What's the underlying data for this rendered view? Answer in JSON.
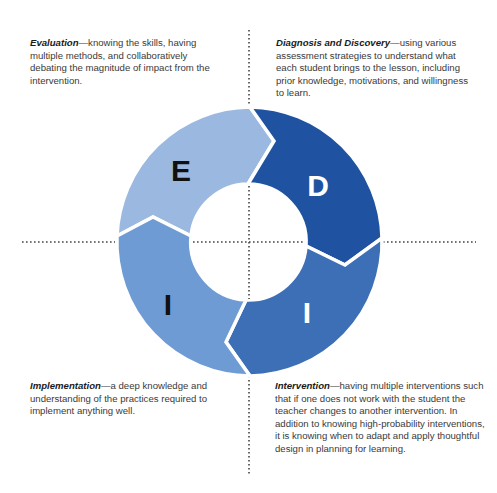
{
  "diagram": {
    "type": "cycle",
    "center": [
      249,
      242
    ],
    "outer_radius": 134,
    "inner_radius": 58,
    "segments": [
      {
        "id": "evaluation",
        "letter": "E",
        "color": "#9bb9e0",
        "letter_color": "#111111"
      },
      {
        "id": "diagnosis",
        "letter": "D",
        "color": "#1f52a0",
        "letter_color": "#ffffff"
      },
      {
        "id": "intervention",
        "letter": "I",
        "color": "#3d6fb6",
        "letter_color": "#ffffff"
      },
      {
        "id": "implementation",
        "letter": "I",
        "color": "#6e9bd4",
        "letter_color": "#111111"
      }
    ],
    "flow": [
      "E",
      "D",
      "I",
      "I"
    ],
    "separator_color": "#ffffff",
    "axis_line_color": "#444444"
  },
  "descriptions": {
    "evaluation": {
      "term": "Evaluation",
      "text": "—knowing the skills, having multiple methods, and collaboratively debating the magnitude of impact from the intervention."
    },
    "diagnosis": {
      "term": "Diagnosis and Discovery",
      "text": "—using various assessment strategies to understand what each student brings to the lesson, including prior knowledge, motivations, and willingness to learn."
    },
    "implementation": {
      "term": "Implementation",
      "text": "—a deep knowledge and understanding of the practices required to implement anything well."
    },
    "intervention": {
      "term": "Intervention",
      "text": "—having multiple interventions such that if one does not work with the student the teacher changes to another intervention. In addition to knowing high-probability interventions, it is knowing when to adapt and apply thoughtful design in planning for learning."
    }
  }
}
